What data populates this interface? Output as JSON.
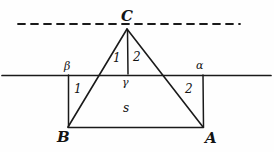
{
  "figure": {
    "type": "geometry-diagram",
    "stroke_color": "#1a1a1a",
    "background_color": "#fefefe"
  },
  "labels": {
    "apex": "C",
    "bottom_left": "B",
    "bottom_right": "A",
    "angle_left": "β",
    "angle_right": "α",
    "angle_center": "γ",
    "sub_angle_left": "1",
    "sub_angle_right": "2",
    "side_left": "1",
    "side_right": "2",
    "area": "s"
  },
  "geometry": {
    "apex": {
      "x": 127,
      "y": 29
    },
    "vertex_b": {
      "x": 68,
      "y": 127
    },
    "vertex_a": {
      "x": 203,
      "y": 127
    },
    "gamma_point": {
      "x": 128,
      "y": 75
    },
    "beta_point": {
      "x": 68,
      "y": 75
    },
    "alpha_point": {
      "x": 203,
      "y": 75
    },
    "dashed_line": {
      "y": 24,
      "x1": 18,
      "x2": 240
    },
    "solid_line": {
      "y": 75,
      "x1": 2,
      "x2": 271
    },
    "cb_crossing": {
      "x": 98,
      "y": 75
    },
    "ca_crossing": {
      "x": 163,
      "y": 75
    }
  }
}
